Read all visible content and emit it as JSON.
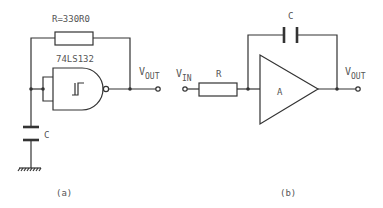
{
  "diagrams": [
    {
      "id": "a",
      "caption": "(a)",
      "resistor_label": "R=330R0",
      "gate_label": "74LS132",
      "capacitor_label": "C",
      "output_label": {
        "main": "V",
        "sub": "OUT"
      },
      "components": [
        "resistor",
        "schmitt-trigger-nand-gate",
        "capacitor",
        "ground",
        "output-terminal"
      ]
    },
    {
      "id": "b",
      "caption": "(b)",
      "input_label": {
        "main": "V",
        "sub": "IN"
      },
      "resistor_label": "R",
      "capacitor_label": "C",
      "amplifier_label": "A",
      "output_label": {
        "main": "V",
        "sub": "OUT"
      },
      "components": [
        "input-terminal",
        "resistor",
        "capacitor",
        "op-amp-integrator",
        "output-terminal"
      ]
    }
  ],
  "colors": {
    "line": "#333333",
    "text": "#555555",
    "background": "#ffffff"
  }
}
